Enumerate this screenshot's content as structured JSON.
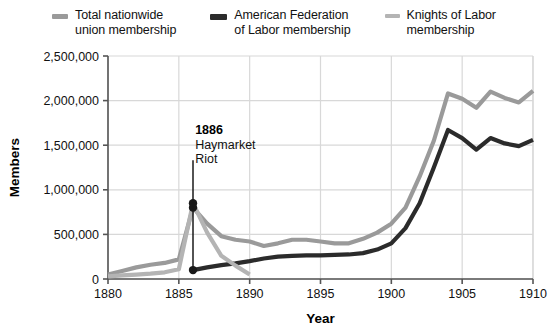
{
  "legend": {
    "items": [
      {
        "label": "Total nationwide\nunion membership",
        "color": "#9a9a9a",
        "width": 16,
        "height": 5,
        "name": "legend-total"
      },
      {
        "label": "American Federation\nof Labor membership",
        "color": "#2b2b2b",
        "width": 17,
        "height": 6,
        "name": "legend-afl"
      },
      {
        "label": "Knights of Labor\nmembership",
        "color": "#b4b4b4",
        "width": 15,
        "height": 4,
        "name": "legend-knights"
      }
    ]
  },
  "chart_data": {
    "type": "line",
    "title": "",
    "xlabel": "Year",
    "ylabel": "Members",
    "xlim": [
      1880,
      1910
    ],
    "ylim": [
      0,
      2500000
    ],
    "xticks": [
      1880,
      1885,
      1890,
      1895,
      1900,
      1905,
      1910
    ],
    "xticklabels": [
      "1880",
      "1885",
      "1890",
      "1895",
      "1900",
      "1905",
      "1910"
    ],
    "yticks": [
      0,
      500000,
      1000000,
      1500000,
      2000000,
      2500000
    ],
    "yticklabels": [
      "0",
      "500,000",
      "1,000,000",
      "1,500,000",
      "2,000,000",
      "2,500,000"
    ],
    "grid": true,
    "grid_color": "#d8d8d8",
    "legend_position": "top-center",
    "series": [
      {
        "name": "Total nationwide union membership",
        "color": "#9a9a9a",
        "stroke_width": 4.2,
        "x": [
          1880,
          1881,
          1882,
          1883,
          1884,
          1885,
          1886,
          1887,
          1888,
          1889,
          1890,
          1891,
          1892,
          1893,
          1894,
          1895,
          1896,
          1897,
          1898,
          1899,
          1900,
          1901,
          1902,
          1903,
          1904,
          1905,
          1906,
          1907,
          1908,
          1909,
          1910
        ],
        "y": [
          50000,
          90000,
          130000,
          160000,
          180000,
          220000,
          800000,
          620000,
          480000,
          440000,
          420000,
          370000,
          400000,
          440000,
          440000,
          420000,
          400000,
          400000,
          450000,
          520000,
          620000,
          800000,
          1150000,
          1550000,
          2080000,
          2020000,
          1920000,
          2100000,
          2030000,
          1980000,
          2110000
        ]
      },
      {
        "name": "American Federation of Labor membership",
        "color": "#2b2b2b",
        "stroke_width": 4.2,
        "x": [
          1886,
          1887,
          1888,
          1889,
          1890,
          1891,
          1892,
          1893,
          1894,
          1895,
          1896,
          1897,
          1898,
          1899,
          1900,
          1901,
          1902,
          1903,
          1904,
          1905,
          1906,
          1907,
          1908,
          1909,
          1910
        ],
        "y": [
          100000,
          130000,
          155000,
          175000,
          200000,
          230000,
          250000,
          260000,
          265000,
          265000,
          270000,
          275000,
          290000,
          330000,
          400000,
          570000,
          850000,
          1250000,
          1670000,
          1580000,
          1450000,
          1580000,
          1520000,
          1490000,
          1560000
        ]
      },
      {
        "name": "Knights of Labor membership",
        "color": "#b4b4b4",
        "stroke_width": 4.2,
        "x": [
          1880,
          1881,
          1882,
          1883,
          1884,
          1885,
          1886,
          1887,
          1888,
          1889,
          1890
        ],
        "y": [
          30000,
          40000,
          50000,
          60000,
          75000,
          110000,
          850000,
          520000,
          260000,
          150000,
          50000
        ]
      }
    ],
    "markers": [
      {
        "x": 1886,
        "y": 850000,
        "color": "#1a1a1a",
        "r": 4.2,
        "name": "marker-knights-1886"
      },
      {
        "x": 1886,
        "y": 800000,
        "color": "#1a1a1a",
        "r": 4.2,
        "name": "marker-total-1886"
      },
      {
        "x": 1886,
        "y": 100000,
        "color": "#1a1a1a",
        "r": 4.2,
        "name": "marker-afl-1886"
      }
    ],
    "annotations": [
      {
        "name": "haymarket-annotation",
        "head": "1886",
        "body": "Haymarket\nRiot",
        "text_x": 1886.15,
        "text_y": 1620000,
        "leader_x": 1886,
        "leader_y_top": 1330000,
        "leader_y_bottom": 100000,
        "leader_color": "#1a1a1a"
      }
    ]
  }
}
